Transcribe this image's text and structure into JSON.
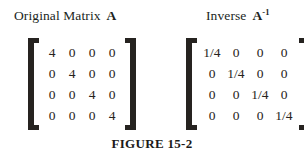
{
  "figure": {
    "caption": "FIGURE 15-2",
    "panels": [
      {
        "id": "original",
        "title_text": "Original Matrix",
        "title_symbol": "A",
        "title_superscript": "",
        "rows": [
          [
            "4",
            "0",
            "0",
            "0"
          ],
          [
            "0",
            "4",
            "0",
            "0"
          ],
          [
            "0",
            "0",
            "4",
            "0"
          ],
          [
            "0",
            "0",
            "0",
            "4"
          ]
        ]
      },
      {
        "id": "inverse",
        "title_text": "Inverse",
        "title_symbol": "A",
        "title_superscript": "-1",
        "rows": [
          [
            "1/4",
            "0",
            "0",
            "0"
          ],
          [
            "0",
            "1/4",
            "0",
            "0"
          ],
          [
            "0",
            "0",
            "1/4",
            "0"
          ],
          [
            "0",
            "0",
            "0",
            "1/4"
          ]
        ]
      }
    ],
    "bracket_color": "#262320",
    "text_color": "#1c1a18",
    "background_color": "#ffffff"
  },
  "chart_data": {
    "type": "table",
    "title": "FIGURE 15-2",
    "matrices": [
      {
        "name": "Original Matrix A",
        "size": [
          4,
          4
        ],
        "values": [
          [
            4,
            0,
            0,
            0
          ],
          [
            0,
            4,
            0,
            0
          ],
          [
            0,
            0,
            4,
            0
          ],
          [
            0,
            0,
            0,
            4
          ]
        ]
      },
      {
        "name": "Inverse A^-1",
        "size": [
          4,
          4
        ],
        "values": [
          [
            0.25,
            0,
            0,
            0
          ],
          [
            0,
            0.25,
            0,
            0
          ],
          [
            0,
            0,
            0.25,
            0
          ],
          [
            0,
            0,
            0,
            0.25
          ]
        ]
      }
    ]
  }
}
